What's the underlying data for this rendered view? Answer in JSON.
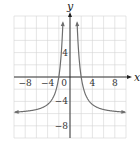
{
  "chart_data": {
    "type": "line",
    "title": "",
    "xlabel": "x",
    "ylabel": "y",
    "xlim": [
      -10,
      10
    ],
    "ylim": [
      -10,
      10
    ],
    "grid": true,
    "grid_step": 2,
    "x_ticks": [
      -8,
      -4,
      0,
      4,
      8
    ],
    "y_ticks": [
      4,
      -4,
      -8
    ],
    "x_tick_labels": [
      "−8",
      "−4",
      "0",
      "4",
      "8"
    ],
    "y_tick_labels": [
      "4",
      "−4",
      "−8"
    ],
    "series": [
      {
        "name": "y = 24/x^2 - 6",
        "equation": "y = 24/x^2 - 6",
        "color": "#6e6e6e",
        "branches": [
          {
            "x": [
              -9.8,
              -8,
              -6,
              -4,
              -3,
              -2,
              -1.5,
              -1.2,
              -1.05
            ],
            "y": [
              -5.75,
              -5.63,
              -5.33,
              -4.5,
              -3.33,
              0,
              4.67,
              10.67,
              15.8
            ]
          },
          {
            "x": [
              1.05,
              1.2,
              1.5,
              2,
              3,
              4,
              6,
              8,
              9.8
            ],
            "y": [
              15.8,
              10.67,
              4.67,
              0,
              -3.33,
              -4.5,
              -5.33,
              -5.63,
              -5.75
            ]
          }
        ],
        "x_intercepts": [
          -2,
          2
        ],
        "vertical_asymptote": 0,
        "horizontal_asymptote": -6
      }
    ]
  }
}
